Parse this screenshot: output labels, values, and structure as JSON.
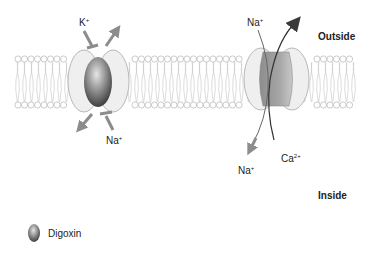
{
  "diagram": {
    "regions": {
      "outside": "Outside",
      "inside": "Inside"
    },
    "left_pump": {
      "name": "Na+/K+ ATPase",
      "ion_top": "K",
      "ion_top_charge": "+",
      "ion_bottom": "Na",
      "ion_bottom_charge": "+",
      "inhibitor": "Digoxin"
    },
    "right_exchanger": {
      "name": "Na+/Ca2+ exchanger",
      "ion_top": "Na",
      "ion_top_charge": "+",
      "ion_bottom_left": "Na",
      "ion_bottom_left_charge": "+",
      "ion_bottom_right": "Ca",
      "ion_bottom_right_charge": "2+"
    },
    "legend": {
      "digoxin_label": "Digoxin"
    },
    "colors": {
      "membrane_line": "#b5b5b5",
      "protein_fill": "#eeeeee",
      "protein_stroke": "#a8a8a8",
      "digoxin_dark": "#555555",
      "digoxin_light": "#dcdcdc",
      "arrow_gray": "#8c8c8c",
      "arrow_dark": "#3a3a3a",
      "exchanger_band": "#9a9a9a"
    }
  }
}
